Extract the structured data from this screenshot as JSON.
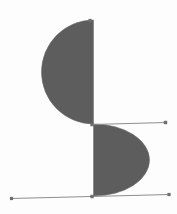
{
  "scene": {
    "name": "geometric-figure",
    "description": "S-shaped figure formed by two opposed half-discs joined along a vertical axis, with two thin horizontal construction lines ending in small square node markers",
    "width": 177,
    "height": 214,
    "background_color": "#fdfdfd"
  },
  "palette": {
    "fill_gray": "#5d5d5d",
    "fill_gray_edge": "#6a6a6a",
    "line_gray": "#8e8e8e",
    "node_gray": "#6e6e6e",
    "background": "#fdfdfd"
  },
  "geometry": {
    "axis_x": 93,
    "upper_half_disc": {
      "name": "upper-half-disc",
      "bulge_direction": "left",
      "top_y": 20,
      "bottom_y": 124,
      "leftmost_x": 43,
      "radius": 52,
      "center": {
        "x": 93,
        "y": 72
      },
      "path": "M 93.5 20 L 93.5 124 A 52 52 0 0 1 93.5 20 Z"
    },
    "lower_half_disc": {
      "name": "lower-half-disc",
      "bulge_direction": "right",
      "top_y": 124,
      "bottom_y": 196,
      "rightmost_x": 149,
      "radius_x": 56,
      "radius_y": 36,
      "center": {
        "x": 93,
        "y": 160
      },
      "path": "M 93.5 124 L 93.5 196 A 56 36 0 0 0 93.5 124 Z"
    },
    "axis_line": {
      "name": "vertical-axis-line",
      "x1": 93.5,
      "y1": 20,
      "x2": 93.5,
      "y2": 196
    },
    "middle_rule": {
      "name": "middle-horizontal-rule",
      "x1": 92,
      "y1": 124.5,
      "x2": 166,
      "y2": 122.5
    },
    "bottom_rule": {
      "name": "bottom-horizontal-rule",
      "x1": 11,
      "y1": 198.5,
      "x2": 170,
      "y2": 194.5
    }
  },
  "nodes": [
    {
      "name": "node-apex-top",
      "x": 90,
      "y": 20.5,
      "size": 3.2
    },
    {
      "name": "node-axis-middle",
      "x": 92,
      "y": 124.5,
      "size": 3.4
    },
    {
      "name": "node-axis-bottom",
      "x": 92,
      "y": 196.5,
      "size": 3.4
    },
    {
      "name": "node-middle-right",
      "x": 165.5,
      "y": 122.5,
      "size": 3.4
    },
    {
      "name": "node-bottom-left",
      "x": 11.5,
      "y": 198.5,
      "size": 3.2
    },
    {
      "name": "node-bottom-right",
      "x": 169,
      "y": 194.5,
      "size": 3.2
    }
  ]
}
